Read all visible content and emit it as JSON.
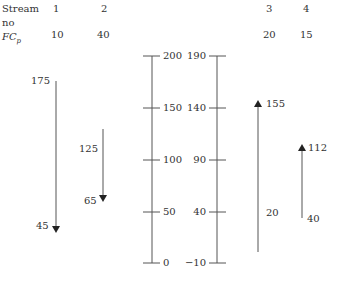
{
  "header": {
    "stream_label": "Stream",
    "no_label": "no",
    "fcp_label": "FC",
    "fcp_sub": "p",
    "streams": [
      {
        "no": "1",
        "fcp": "10"
      },
      {
        "no": "2",
        "fcp": "40"
      },
      {
        "no": "3",
        "fcp": "20"
      },
      {
        "no": "4",
        "fcp": "15"
      }
    ]
  },
  "scales": {
    "hot": {
      "ticks": [
        "200",
        "150",
        "100",
        "50",
        "0"
      ]
    },
    "cold": {
      "ticks": [
        "190",
        "140",
        "90",
        "40",
        "−10"
      ]
    }
  },
  "arrows": [
    {
      "stream": "1",
      "type": "hot",
      "supply": "175",
      "target": "45"
    },
    {
      "stream": "2",
      "type": "hot",
      "supply": "125",
      "target": "65"
    },
    {
      "stream": "3",
      "type": "cold",
      "supply": "20",
      "target": "155"
    },
    {
      "stream": "4",
      "type": "cold",
      "supply": "40",
      "target": "112"
    }
  ],
  "colors": {
    "line": "#555555",
    "text": "#333333"
  }
}
